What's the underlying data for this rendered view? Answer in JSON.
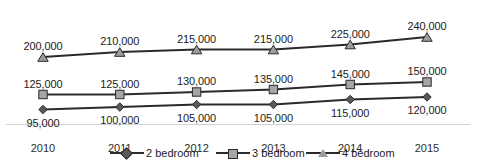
{
  "chart_data": {
    "type": "line",
    "title": "",
    "xlabel": "",
    "ylabel": "",
    "grid": false,
    "legend_position": "bottom",
    "categories": [
      "2010",
      "2011",
      "2012",
      "2013",
      "2014",
      "2015"
    ],
    "ylim": [
      90000,
      250000
    ],
    "series": [
      {
        "name": "2 bedroom",
        "marker": "diamond",
        "color": "#595959",
        "label_position": "below",
        "values": [
          95000,
          100000,
          105000,
          105000,
          115000,
          120000
        ],
        "value_labels": [
          "95,000",
          "100,000",
          "105,000",
          "105,000",
          "115,000",
          "120,000"
        ]
      },
      {
        "name": "3 bedroom",
        "marker": "square",
        "color": "#a6a6a6",
        "label_position": "above",
        "values": [
          125000,
          125000,
          130000,
          135000,
          145000,
          150000
        ],
        "value_labels": [
          "125,000",
          "125,000",
          "130,000",
          "135,000",
          "145,000",
          "150,000"
        ]
      },
      {
        "name": "4 bedroom",
        "marker": "triangle",
        "color": "#9d9d9d",
        "label_position": "above",
        "values": [
          200000,
          210000,
          215000,
          215000,
          225000,
          240000
        ],
        "value_labels": [
          "200,000",
          "210,000",
          "215,000",
          "215,000",
          "225,000",
          "240,000"
        ]
      }
    ]
  },
  "axis": {
    "tick_labels": [
      "2010",
      "2011",
      "2012",
      "2013",
      "2014",
      "2015"
    ]
  },
  "legend": {
    "items": [
      {
        "label": "2 bedroom",
        "marker": "diamond"
      },
      {
        "label": "3 bedroom",
        "marker": "square"
      },
      {
        "label": "4 bedroom",
        "marker": "triangle"
      }
    ]
  }
}
